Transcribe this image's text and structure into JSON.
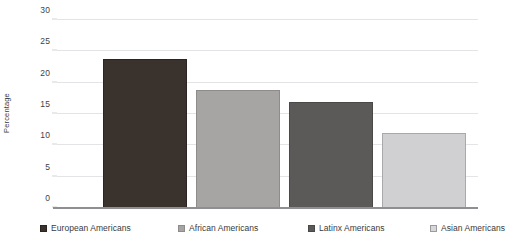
{
  "chart_data": {
    "type": "bar",
    "title": "",
    "subtitle": "",
    "xlabel": "",
    "ylabel": "Percentage",
    "ylim": [
      0,
      30
    ],
    "ytick_labels": [
      "0",
      "5",
      "10",
      "15",
      "20",
      "25",
      "30"
    ],
    "ytick_values": [
      0,
      5,
      10,
      15,
      20,
      25,
      30
    ],
    "grid": true,
    "legend_position": "bottom",
    "categories": [
      "European Americans",
      "African Americans",
      "Latinx Americans",
      "Asian Americans"
    ],
    "values": [
      23.8,
      18.9,
      16.9,
      12.0
    ],
    "colors": [
      "#3a322d",
      "#a6a5a4",
      "#5c5a58",
      "#d0d0d3"
    ],
    "bar_edge_colors": [
      "#2b2420",
      "#8d8c8b",
      "#4b4947",
      "#a9a9ad"
    ],
    "series": [
      {
        "name": "Percentage",
        "values": [
          23.8,
          18.9,
          16.9,
          12.0
        ]
      }
    ],
    "annotations": []
  },
  "legend": {
    "items": [
      {
        "label": "European Americans",
        "color": "#3a322d",
        "edge": "#2b2420"
      },
      {
        "label": "African Americans",
        "color": "#a6a5a4",
        "edge": "#8d8c8b"
      },
      {
        "label": "Latinx Americans",
        "color": "#5c5a58",
        "edge": "#4b4947"
      },
      {
        "label": "Asian Americans",
        "color": "#d7d7da",
        "edge": "#9b9b9f"
      }
    ]
  },
  "axes": {
    "y_title": "Percentage",
    "baseline_color": "#8f8f93",
    "gridline_color": "#e4e4e6"
  }
}
